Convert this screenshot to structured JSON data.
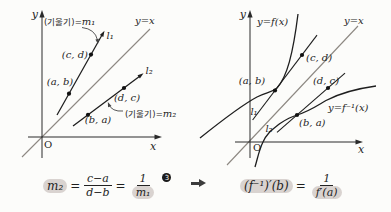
{
  "left_graph": {
    "y_axis_label": "y",
    "x_axis_label": "x",
    "origin_label": "O",
    "identity_label": "y=x",
    "line1_label": "l₁",
    "line2_label": "l₂",
    "slope1_prefix": "(기울기)=",
    "slope1_var": "m₁",
    "slope2_prefix": "(기울기)=",
    "slope2_var": "m₂",
    "point_ab": "(a, b)",
    "point_cd": "(c, d)",
    "point_ba": "(b, a)",
    "point_dc": "(d, c)"
  },
  "right_graph": {
    "y_axis_label": "y",
    "x_axis_label": "x",
    "origin_label": "O",
    "identity_label": "y=x",
    "f_label": "y=f(x)",
    "f_inv_label": "y=f⁻¹(x)",
    "tangent1_label": "l₁",
    "tangent2_label": "l₂",
    "point_ab": "(a, b)",
    "point_cd": "(c, d)",
    "point_ba": "(b, a)",
    "point_dc": "(d, c)"
  },
  "formula_left": {
    "lhs": "m₂",
    "equals1": "=",
    "num1": "c−a",
    "den1": "d−b",
    "equals2": "=",
    "num2": "1",
    "den2": "m₁",
    "marker": "3"
  },
  "formula_right": {
    "lhs": "(f⁻¹)′(b)",
    "equals": "=",
    "num": "1",
    "den": "f′(a)"
  },
  "colors": {
    "ink": "#1e1e1e",
    "identity_line": "#8d8882",
    "highlight": "#d9d3d0"
  }
}
